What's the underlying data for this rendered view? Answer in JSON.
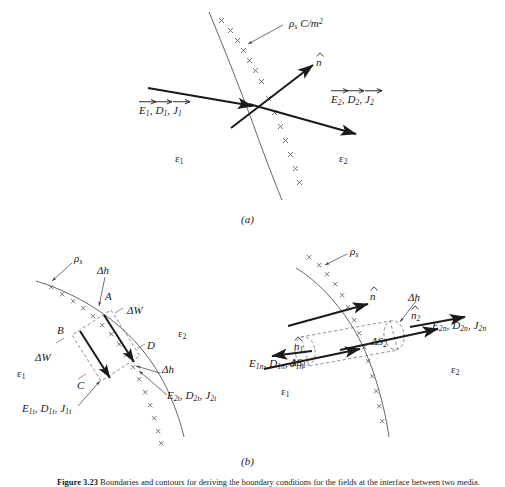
{
  "figure": {
    "caption_number": "Figure 3.23",
    "caption_text": "Boundaries and contours for deriving the boundary conditions for the fields at the interface between two media.",
    "panel_a_tag": "(a)",
    "panel_b_tag": "(b)"
  },
  "colors": {
    "ink": "#1a1a1a",
    "interface_curve": "#55555a",
    "charge_mark": "#5a5a60",
    "dashed_guide": "#6a6a70",
    "background": "#ffffff"
  },
  "panel_a": {
    "surface_charge_label": "ρs C/m2",
    "surface_charge_symbol": "ρ",
    "surface_charge_sub": "s",
    "surface_charge_units": "C/m",
    "surface_charge_units_exp": "2",
    "normal_vector_label": "n̂",
    "field_left_label": "E⃗1, D⃗1, J⃗1",
    "field_right_label": "E⃗2, D⃗2, J⃗2",
    "medium_1_label": "ε1",
    "medium_2_label": "ε2",
    "medium_1_symbol": "ε",
    "medium_1_sub": "1",
    "medium_2_symbol": "ε",
    "medium_2_sub": "2",
    "charge_mark_glyph": "×",
    "charge_mark_count": 14
  },
  "panel_b_left": {
    "title_role": "tangential-contour",
    "surface_charge_symbol": "ρ",
    "surface_charge_sub": "s",
    "corner_a": "A",
    "corner_b": "B",
    "corner_c": "C",
    "corner_d": "D",
    "delta_h_label": "Δh",
    "delta_h_label_2": "Δh",
    "delta_w_label": "ΔW",
    "delta_w_label_2": "ΔW",
    "field_tangential_1": "E1t, D1t, J1t",
    "field_tangential_2": "E2t, D2t, J2t",
    "medium_1_symbol": "ε",
    "medium_1_sub": "1",
    "medium_2_symbol": "ε",
    "medium_2_sub": "2",
    "charge_mark_glyph": "×"
  },
  "panel_b_right": {
    "title_role": "normal-pillbox",
    "surface_charge_symbol": "ρ",
    "surface_charge_sub": "s",
    "normal_vector_label": "n̂",
    "normal_vector_1_label": "n̂1",
    "normal_vector_2_label": "n̂2",
    "delta_h_label": "Δh",
    "delta_s_1_label": "ΔS1",
    "delta_s_2_label": "ΔS2",
    "field_normal_1": "E1n, D1n, J1n",
    "field_normal_2": "E2n, D2n, J2n",
    "medium_1_symbol": "ε",
    "medium_1_sub": "1",
    "medium_2_symbol": "ε",
    "medium_2_sub": "2",
    "charge_mark_glyph": "×"
  }
}
